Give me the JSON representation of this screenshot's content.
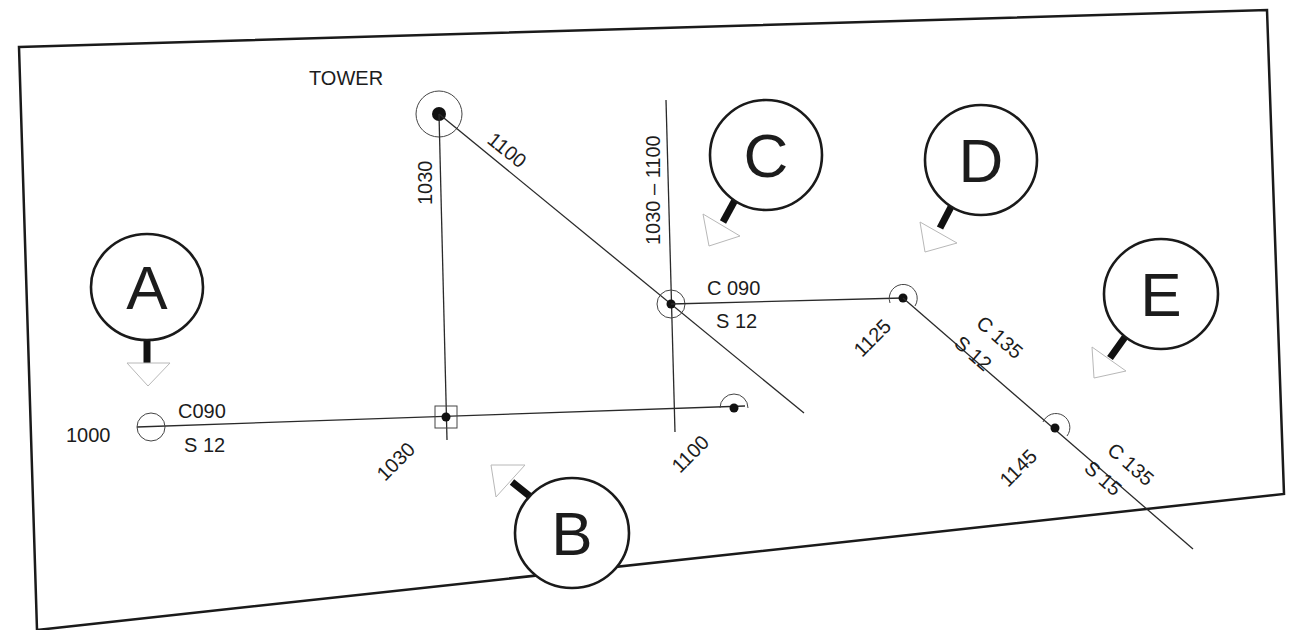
{
  "diagram": {
    "title_label": "TOWER",
    "colors": {
      "ink": "#1c1c1c",
      "background": "#ffffff",
      "triangle_outline": "#b8b8b8"
    },
    "border": {
      "points": "19,47 1267,10 1284,494 37,630"
    },
    "fixes": {
      "tower": {
        "x": 439,
        "y": 114,
        "ring_r": 23
      },
      "start_1000": {
        "x": 151,
        "y": 427,
        "time": "1000"
      },
      "fix_1030": {
        "x": 446,
        "y": 417,
        "time": "1030"
      },
      "fix_1100_lower": {
        "x": 734,
        "y": 408,
        "time": "1100"
      },
      "center_fix": {
        "x": 671,
        "y": 304
      },
      "fix_1125": {
        "x": 903,
        "y": 298,
        "time": "1125"
      },
      "fix_1145": {
        "x": 1055,
        "y": 428,
        "time": "1145"
      }
    },
    "labels": {
      "leg1_course": "C090",
      "leg1_speed": "S 12",
      "bearing_1030": "1030",
      "bearing_1100": "1100",
      "bearing_range": "1030 – 1100",
      "leg2_course": "C 090",
      "leg2_speed": "S 12",
      "time_1030": "1030",
      "time_1100": "1100",
      "time_1000": "1000",
      "time_1125": "1125",
      "time_1145": "1145",
      "leg3_course": "C 135",
      "leg3_speed": "S 12",
      "leg4_course": "C 135",
      "leg4_speed": "S 15"
    },
    "callouts": [
      {
        "letter": "A",
        "cx": 147,
        "cy": 287
      },
      {
        "letter": "B",
        "cx": 572,
        "cy": 533
      },
      {
        "letter": "C",
        "cx": 766,
        "cy": 155
      },
      {
        "letter": "D",
        "cx": 981,
        "cy": 160
      },
      {
        "letter": "E",
        "cx": 1161,
        "cy": 294
      }
    ]
  }
}
